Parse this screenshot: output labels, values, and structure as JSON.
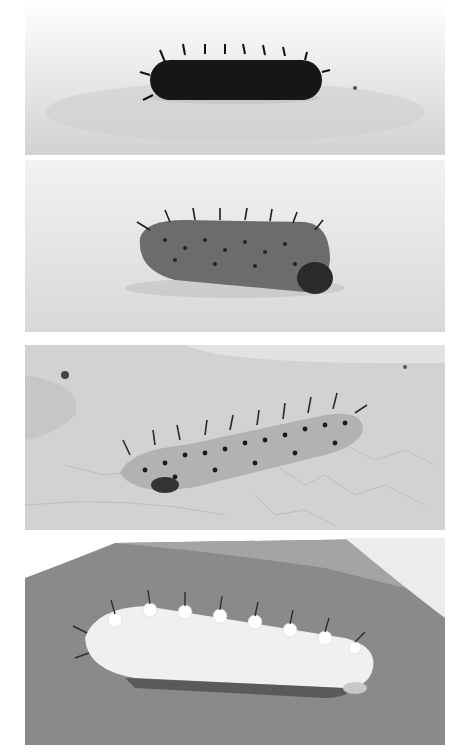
{
  "figure": {
    "panels": [
      {
        "index": 1,
        "subject": "dark, nearly black spiny caterpillar on a pale textured surface",
        "background": "#e4e4e4",
        "body_color": "#1a1a1a"
      },
      {
        "index": 2,
        "subject": "mid-gray spotted spiny caterpillar on a pale textured surface",
        "background": "#e8e8e8",
        "body_color": "#6e6e6e"
      },
      {
        "index": 3,
        "subject": "light gray black-spotted caterpillar with dark branched spines on a veined leaf",
        "background": "#d9d9d9",
        "body_color": "#b4b4b4"
      },
      {
        "index": 4,
        "subject": "pale white caterpillar with tubercles and spines on a dark leaf",
        "background": "#8a8a8a",
        "body_color": "#f2f2f2"
      }
    ]
  }
}
